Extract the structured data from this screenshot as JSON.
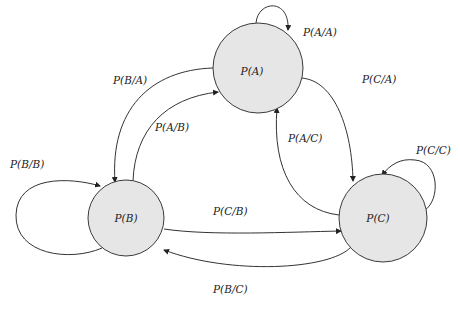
{
  "diagram": {
    "type": "state-transition-diagram",
    "colors": {
      "node_fill": "#e6e6e6",
      "stroke": "#333333",
      "background": "#ffffff"
    },
    "nodes": [
      {
        "id": "A",
        "label": "P(A)"
      },
      {
        "id": "B",
        "label": "P(B)"
      },
      {
        "id": "C",
        "label": "P(C)"
      }
    ],
    "edges": [
      {
        "from": "A",
        "to": "A",
        "label": "P(A/A)"
      },
      {
        "from": "A",
        "to": "B",
        "label": "P(B/A)"
      },
      {
        "from": "A",
        "to": "C",
        "label": "P(C/A)"
      },
      {
        "from": "B",
        "to": "A",
        "label": "P(A/B)"
      },
      {
        "from": "B",
        "to": "B",
        "label": "P(B/B)"
      },
      {
        "from": "B",
        "to": "C",
        "label": "P(C/B)"
      },
      {
        "from": "C",
        "to": "A",
        "label": "P(A/C)"
      },
      {
        "from": "C",
        "to": "B",
        "label": "P(B/C)"
      },
      {
        "from": "C",
        "to": "C",
        "label": "P(C/C)"
      }
    ]
  }
}
